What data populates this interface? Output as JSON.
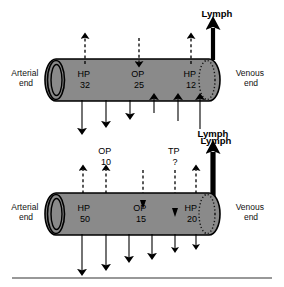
{
  "figure": {
    "baseline_rule": true,
    "colors": {
      "vessel_fill": "#8a8a8a",
      "vessel_stroke": "#000000",
      "arrow": "#000000",
      "background": "#ffffff",
      "rule": "#333333"
    }
  },
  "diagrams": [
    {
      "id": "top",
      "arterial_label_line1": "Arterial",
      "arterial_label_line2": "end",
      "venous_label_line1": "Venous",
      "venous_label_line2": "end",
      "pressures": [
        {
          "name": "HP",
          "value": "32"
        },
        {
          "name": "OP",
          "value": "25"
        },
        {
          "name": "HP",
          "value": "12"
        }
      ],
      "lymph_label": "Lymph",
      "lymph_label_bottom": "Lymph",
      "dashed_arrows": [
        {
          "dir": "up"
        },
        {
          "dir": "down"
        },
        {
          "dir": "up"
        }
      ],
      "net_arrows": [
        {
          "dir": "down",
          "len": "long"
        },
        {
          "dir": "down",
          "len": "medium"
        },
        {
          "dir": "down",
          "len": "short"
        },
        {
          "dir": "up",
          "len": "short"
        },
        {
          "dir": "up",
          "len": "medium"
        },
        {
          "dir": "up",
          "len": "long"
        }
      ]
    },
    {
      "id": "bottom",
      "arterial_label_line1": "Arterial",
      "arterial_label_line2": "end",
      "venous_label_line1": "Venous",
      "venous_label_line2": "end",
      "pressures": [
        {
          "name": "HP",
          "value": "50"
        },
        {
          "name": "OP",
          "value": "15"
        },
        {
          "name": "HP",
          "value": "20"
        }
      ],
      "outer_labels": [
        {
          "name": "OP",
          "value": "10"
        },
        {
          "name": "TP",
          "value": "?"
        }
      ],
      "lymph_label": "Lymph",
      "dashed_arrows": [
        {
          "dir": "up"
        },
        {
          "dir": "up"
        },
        {
          "dir": "down"
        },
        {
          "dir": "down"
        },
        {
          "dir": "up"
        }
      ],
      "net_arrows": [
        {
          "dir": "down",
          "len": "long"
        },
        {
          "dir": "down",
          "len": "long"
        },
        {
          "dir": "down",
          "len": "medium"
        },
        {
          "dir": "down",
          "len": "medium"
        },
        {
          "dir": "down",
          "len": "short"
        },
        {
          "dir": "down",
          "len": "short"
        }
      ]
    }
  ]
}
